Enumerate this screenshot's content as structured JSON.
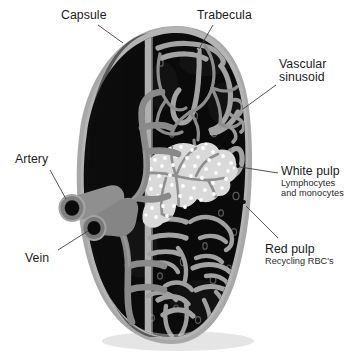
{
  "figure": {
    "background_color": "#ffffff"
  },
  "colors": {
    "capsule": "#9b9b9b",
    "capsule_light": "#b6b6b6",
    "red_pulp": "#0d0d0d",
    "red_pulp_dark": "#080808",
    "white_pulp": "#d8d8d8",
    "white_pulp_dots": "#ffffff",
    "vessel": "#8a8a8a",
    "vessel_dark": "#6e6e6e",
    "trabecula": "#a5a5a5",
    "leader_line": "#4a4a4a",
    "text": "#1b1b1b"
  },
  "labels": {
    "capsule": {
      "title": "Capsule"
    },
    "trabecula": {
      "title": "Trabecula"
    },
    "vascular_sinusoid": {
      "title_line1": "Vascular",
      "title_line2": "sinusoid"
    },
    "artery": {
      "title": "Artery"
    },
    "vein": {
      "title": "Vein"
    },
    "white_pulp": {
      "title": "White pulp",
      "sub_line1": "Lymphocytes",
      "sub_line2": "and monocytes"
    },
    "red_pulp": {
      "title": "Red pulp",
      "sub_line1": "Recycling RBC's"
    }
  },
  "structures": [
    {
      "name": "capsule",
      "description": "Outer fibrous grey capsule enclosing the organ"
    },
    {
      "name": "trabecula",
      "description": "Grey fibrous bands extending inward from the capsule"
    },
    {
      "name": "vascular-sinusoid",
      "description": "Vascular channels within the red pulp"
    },
    {
      "name": "white-pulp",
      "description": "Pale dotted lymphoid region around central arteriole"
    },
    {
      "name": "red-pulp",
      "description": "Dark region filling the bulk of the cross-section"
    },
    {
      "name": "splenic-artery",
      "description": "Upper tubular vessel entering at the hilum"
    },
    {
      "name": "splenic-vein",
      "description": "Lower tubular vessel leaving at the hilum"
    }
  ]
}
